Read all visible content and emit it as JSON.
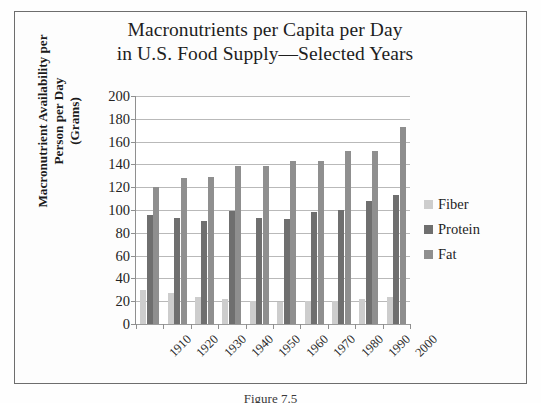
{
  "figure": {
    "caption": "Figure 7.5"
  },
  "chart_data": {
    "type": "bar",
    "title": "Macronutrients per Capita per Day in U.S. Food Supply—Selected Years",
    "title_lines": [
      "Macronutrients per Capita per Day",
      "in U.S. Food Supply—Selected Years"
    ],
    "xlabel": "",
    "ylabel": "Macronutrient Availability per Person per Day (Grams)",
    "ylabel_lines": [
      "Macronutrient Availability per",
      "Person per Day",
      "(Grams)"
    ],
    "categories": [
      "1910",
      "1920",
      "1930",
      "1940",
      "1950",
      "1960",
      "1970",
      "1980",
      "1990",
      "2000"
    ],
    "series": [
      {
        "name": "Fiber",
        "color": "#cdcdcd",
        "values": [
          30,
          27,
          24,
          22,
          20,
          19,
          20,
          20,
          22,
          24
        ]
      },
      {
        "name": "Protein",
        "color": "#6f6f6f",
        "values": [
          96,
          93,
          90,
          99,
          93,
          92,
          98,
          100,
          108,
          113
        ]
      },
      {
        "name": "Fat",
        "color": "#8f8f8f",
        "values": [
          120,
          128,
          129,
          139,
          139,
          143,
          143,
          152,
          152,
          173
        ]
      }
    ],
    "ylim": [
      0,
      200
    ],
    "ytick_values": [
      0,
      20,
      40,
      60,
      80,
      100,
      120,
      140,
      160,
      180,
      200
    ],
    "ytick_labels": [
      "0",
      "20",
      "40",
      "60",
      "80",
      "100",
      "120",
      "140",
      "160",
      "180",
      "200"
    ],
    "grid": true,
    "legend_position": "right",
    "legend_entries": [
      "Fiber",
      "Protein",
      "Fat"
    ]
  }
}
